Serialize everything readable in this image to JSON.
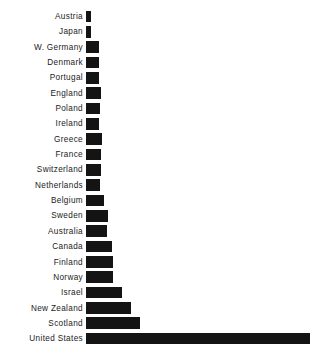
{
  "chart_data": {
    "type": "bar",
    "orientation": "horizontal",
    "title": "",
    "subtitle": "",
    "xlabel": "",
    "ylabel": "",
    "grid": false,
    "legend": null,
    "axis_visible": false,
    "tick_labels_x": [],
    "xlim": [
      0,
      224
    ],
    "bar_color": "#141414",
    "background_color": "#ffffff",
    "categories": [
      "Austria",
      "Japan",
      "W. Germany",
      "Denmark",
      "Portugal",
      "England",
      "Poland",
      "Ireland",
      "Greece",
      "France",
      "Switzerland",
      "Netherlands",
      "Belgium",
      "Sweden",
      "Australia",
      "Canada",
      "Finland",
      "Norway",
      "Israel",
      "New Zealand",
      "Scotland",
      "United States"
    ],
    "values": [
      5,
      5,
      13,
      13,
      13,
      15,
      14,
      13,
      16,
      15,
      15,
      14,
      18,
      22,
      21,
      26,
      27,
      27,
      36,
      45,
      54,
      224
    ]
  },
  "chart": {
    "footer_note": ""
  }
}
